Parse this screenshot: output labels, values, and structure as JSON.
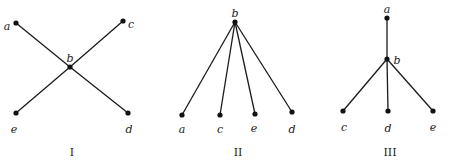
{
  "graphs": [
    {
      "caption": "I",
      "caption_pos": [
        72,
        156
      ],
      "nodes": [
        {
          "id": "a",
          "label": "a",
          "x": 16,
          "y": 23,
          "lx": 7,
          "ly": 30,
          "anchor": "middle"
        },
        {
          "id": "b",
          "label": "b",
          "x": 70,
          "y": 67,
          "lx": 70,
          "ly": 62,
          "anchor": "middle"
        },
        {
          "id": "c",
          "label": "c",
          "x": 123,
          "y": 21,
          "lx": 131,
          "ly": 28,
          "anchor": "middle"
        },
        {
          "id": "d",
          "label": "d",
          "x": 128,
          "y": 113,
          "lx": 129,
          "ly": 133,
          "anchor": "middle"
        },
        {
          "id": "e",
          "label": "e",
          "x": 16,
          "y": 113,
          "lx": 14,
          "ly": 133,
          "anchor": "middle"
        }
      ],
      "edges": [
        [
          "a",
          "b"
        ],
        [
          "b",
          "d"
        ],
        [
          "c",
          "b"
        ],
        [
          "b",
          "e"
        ]
      ]
    },
    {
      "caption": "II",
      "caption_pos": [
        238,
        156
      ],
      "nodes": [
        {
          "id": "b",
          "label": "b",
          "x": 235,
          "y": 22,
          "lx": 235,
          "ly": 17,
          "anchor": "middle"
        },
        {
          "id": "a",
          "label": "a",
          "x": 182,
          "y": 115,
          "lx": 182,
          "ly": 133,
          "anchor": "middle"
        },
        {
          "id": "c",
          "label": "c",
          "x": 220,
          "y": 115,
          "lx": 220,
          "ly": 133,
          "anchor": "middle"
        },
        {
          "id": "e",
          "label": "e",
          "x": 255,
          "y": 114,
          "lx": 254,
          "ly": 132,
          "anchor": "middle"
        },
        {
          "id": "d",
          "label": "d",
          "x": 292,
          "y": 112,
          "lx": 292,
          "ly": 133,
          "anchor": "middle"
        }
      ],
      "edges": [
        [
          "b",
          "a"
        ],
        [
          "b",
          "c"
        ],
        [
          "b",
          "e"
        ],
        [
          "b",
          "d"
        ]
      ]
    },
    {
      "caption": "III",
      "caption_pos": [
        390,
        156
      ],
      "nodes": [
        {
          "id": "a",
          "label": "a",
          "x": 387,
          "y": 18,
          "lx": 387,
          "ly": 13,
          "anchor": "middle"
        },
        {
          "id": "b",
          "label": "b",
          "x": 387,
          "y": 59,
          "lx": 397,
          "ly": 64,
          "anchor": "middle"
        },
        {
          "id": "c",
          "label": "c",
          "x": 343,
          "y": 111,
          "lx": 344,
          "ly": 131,
          "anchor": "middle"
        },
        {
          "id": "d",
          "label": "d",
          "x": 388,
          "y": 111,
          "lx": 388,
          "ly": 132,
          "anchor": "middle"
        },
        {
          "id": "e",
          "label": "e",
          "x": 433,
          "y": 111,
          "lx": 433,
          "ly": 131,
          "anchor": "middle"
        }
      ],
      "edges": [
        [
          "a",
          "b"
        ],
        [
          "b",
          "c"
        ],
        [
          "b",
          "d"
        ],
        [
          "b",
          "e"
        ]
      ]
    }
  ]
}
